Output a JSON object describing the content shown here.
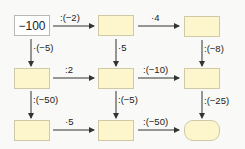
{
  "diagram": {
    "type": "operation-grid",
    "boxes": [
      {
        "id": "r1c1",
        "value": "−100",
        "row": 1,
        "col": 1,
        "kind": "start"
      },
      {
        "id": "r1c2",
        "value": "",
        "row": 1,
        "col": 2,
        "kind": "blank"
      },
      {
        "id": "r1c3",
        "value": "",
        "row": 1,
        "col": 3,
        "kind": "blank"
      },
      {
        "id": "r2c1",
        "value": "",
        "row": 2,
        "col": 1,
        "kind": "blank"
      },
      {
        "id": "r2c2",
        "value": "",
        "row": 2,
        "col": 2,
        "kind": "blank"
      },
      {
        "id": "r2c3",
        "value": "",
        "row": 2,
        "col": 3,
        "kind": "blank"
      },
      {
        "id": "r3c1",
        "value": "",
        "row": 3,
        "col": 1,
        "kind": "blank"
      },
      {
        "id": "r3c2",
        "value": "",
        "row": 3,
        "col": 2,
        "kind": "blank"
      },
      {
        "id": "r3c3",
        "value": "",
        "row": 3,
        "col": 3,
        "kind": "end"
      }
    ],
    "arrows": {
      "r1c1_r1c2": ":(−2)",
      "r1c2_r1c3": "·4",
      "r2c1_r2c2": ":2",
      "r2c2_r2c3": ":(−10)",
      "r3c1_r3c2": "·5",
      "r3c2_r3c3": ":(−50)",
      "r1c1_r2c1": "·(−5)",
      "r2c1_r3c1": ":(−50)",
      "r1c2_r2c2": "·5",
      "r2c2_r3c2": ":(−5)",
      "r1c3_r2c3": ":(−8)",
      "r2c3_r3c3": ":(−25)"
    }
  },
  "colors": {
    "box_fill": "#fdf6cc",
    "box_border": "#cfc9a8",
    "start_fill": "#ffffff",
    "arrow": "#333333",
    "background": "#f9f9f7"
  }
}
